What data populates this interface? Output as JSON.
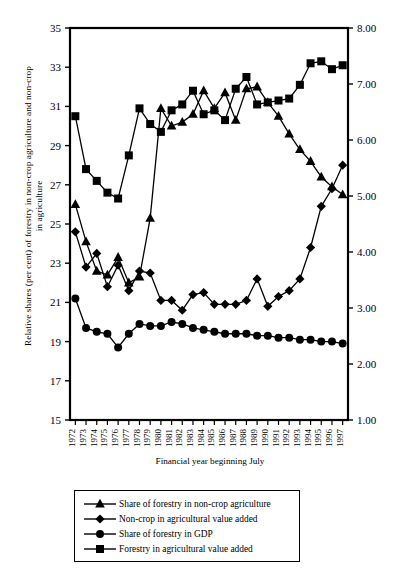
{
  "chart_data": {
    "type": "line",
    "title": "",
    "xlabel": "Financial year beginning July",
    "ylabel_left": "Relative shares (per cent) of forestry in non-crop agriculture and non-crop in agriculture",
    "ylabel_right": "Relative shares (per cent) of forestry in agricuture and GDP",
    "x": [
      1972,
      1973,
      1974,
      1975,
      1976,
      1977,
      1978,
      1979,
      1980,
      1981,
      1982,
      1983,
      1984,
      1985,
      1986,
      1987,
      1988,
      1989,
      1990,
      1991,
      1992,
      1993,
      1994,
      1995,
      1996,
      1997
    ],
    "xticklabels": [
      "1972",
      "1973",
      "1974",
      "1975",
      "1976",
      "1977",
      "1978",
      "1979",
      "1980",
      "1981",
      "1982",
      "1983",
      "1984",
      "1985",
      "1986",
      "1987",
      "1988",
      "1989",
      "1990",
      "1991",
      "1992",
      "1993",
      "1994",
      "1995",
      "1996",
      "1997"
    ],
    "ylim_left": [
      15,
      35
    ],
    "yticks_left": [
      15,
      17,
      19,
      21,
      23,
      25,
      27,
      29,
      31,
      33,
      35
    ],
    "yticklabels_left": [
      "15",
      "17",
      "19",
      "21",
      "23",
      "25",
      "27",
      "29",
      "31",
      "33",
      "35"
    ],
    "ylim_right": [
      1.0,
      8.0
    ],
    "yticks_right": [
      1.0,
      2.0,
      3.0,
      4.0,
      5.0,
      6.0,
      7.0,
      8.0
    ],
    "yticklabels_right": [
      "1.00",
      "2.00",
      "3.00",
      "4.00",
      "5.00",
      "6.00",
      "7.00",
      "8.00"
    ],
    "grid": false,
    "legend_position": "below-plot",
    "series": [
      {
        "name": "Share of forestry in non-crop agriculture",
        "marker": "triangle",
        "axis": "left",
        "values": [
          26.0,
          24.1,
          22.6,
          22.4,
          23.3,
          22.0,
          22.3,
          25.3,
          30.9,
          30.0,
          30.2,
          30.6,
          31.8,
          30.9,
          31.7,
          30.3,
          31.9,
          32.0,
          31.2,
          30.5,
          29.6,
          28.8,
          28.2,
          27.4,
          26.9,
          26.5
        ]
      },
      {
        "name": "Non-crop in agricultural value added",
        "marker": "diamond",
        "axis": "left",
        "values": [
          24.6,
          22.8,
          23.5,
          21.8,
          22.9,
          21.6,
          22.6,
          22.5,
          21.1,
          21.1,
          20.6,
          21.4,
          21.5,
          20.9,
          20.9,
          20.9,
          21.1,
          22.2,
          20.8,
          21.3,
          21.6,
          22.2,
          23.8,
          25.9,
          26.8,
          28.0
        ]
      },
      {
        "name": "Share of forestry in GDP",
        "marker": "circle",
        "axis": "left",
        "values": [
          21.2,
          19.7,
          19.5,
          19.4,
          18.7,
          19.4,
          19.9,
          19.8,
          19.8,
          20.0,
          19.9,
          19.7,
          19.6,
          19.5,
          19.4,
          19.4,
          19.4,
          19.3,
          19.3,
          19.2,
          19.2,
          19.1,
          19.1,
          19.0,
          19.0,
          18.9
        ]
      },
      {
        "name": "Forestry in agricultural value added",
        "marker": "square",
        "axis": "left",
        "values": [
          30.5,
          27.8,
          27.2,
          26.6,
          26.3,
          28.5,
          30.9,
          30.1,
          29.7,
          30.8,
          31.1,
          31.8,
          30.6,
          30.8,
          30.3,
          31.9,
          32.5,
          31.1,
          31.2,
          31.3,
          31.4,
          32.1,
          33.2,
          33.3,
          32.9,
          33.1
        ]
      }
    ],
    "series_right_equivalent": [
      {
        "name": "Share of forestry in GDP",
        "values": [
          3.17,
          2.65,
          2.59,
          2.55,
          2.3,
          2.55,
          2.72,
          2.68,
          2.68,
          2.75,
          2.72,
          2.65,
          2.62,
          2.58,
          2.55,
          2.55,
          2.55,
          2.51,
          2.51,
          2.48,
          2.48,
          2.45,
          2.45,
          2.41,
          2.41,
          2.38
        ]
      },
      {
        "name": "Forestry in agricultural value added",
        "values": [
          6.43,
          5.49,
          5.28,
          5.07,
          4.96,
          5.73,
          6.56,
          6.28,
          6.14,
          6.53,
          6.63,
          6.88,
          6.46,
          6.53,
          6.35,
          6.91,
          7.12,
          6.63,
          6.67,
          6.7,
          6.74,
          6.98,
          7.35,
          7.39,
          7.25,
          7.32
        ]
      }
    ]
  },
  "legend": {
    "items": [
      {
        "label": "Share of forestry in non-crop agriculture",
        "marker": "triangle"
      },
      {
        "label": "Non-crop in agricultural value added",
        "marker": "diamond"
      },
      {
        "label": "Share of forestry in GDP",
        "marker": "circle"
      },
      {
        "label": "Forestry in agricultural value added",
        "marker": "square"
      }
    ]
  },
  "colors": {
    "line": "#000000",
    "marker": "#000000",
    "axis": "#000000",
    "background": "#ffffff"
  }
}
